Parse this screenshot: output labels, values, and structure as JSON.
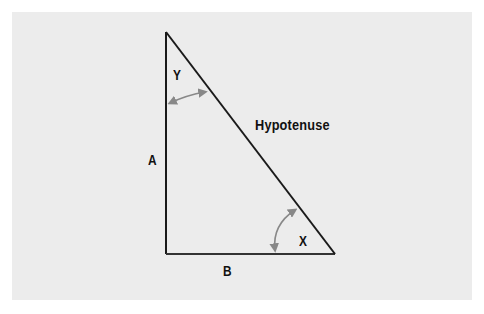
{
  "diagram": {
    "colors": {
      "background": "#ffffff",
      "panel": "#ececec",
      "line": "#1a1a1a",
      "arrow": "#888888",
      "text": "#111111"
    },
    "vertices": {
      "top": [
        166,
        32
      ],
      "bottom_left": [
        166,
        254
      ],
      "bottom_right": [
        335,
        254
      ]
    },
    "labels": {
      "angle_top": "Y",
      "angle_bottom_right": "X",
      "side_vertical": "A",
      "side_horizontal": "B",
      "hypotenuse": "Hypotenuse"
    },
    "arrows": [
      {
        "name": "angle-y-arrow",
        "from": [
          170,
          103
        ],
        "to": [
          204,
          92
        ]
      },
      {
        "name": "angle-x-arrow",
        "from": [
          275,
          250
        ],
        "to": [
          295,
          210
        ]
      }
    ]
  }
}
